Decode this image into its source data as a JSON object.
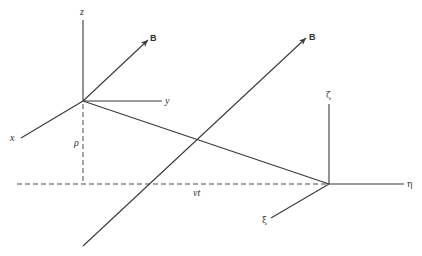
{
  "diagram": {
    "frame1": {
      "origin": [
        83,
        101
      ],
      "labels": {
        "z": "z",
        "y": "y",
        "x": "x",
        "B": "B"
      }
    },
    "frame2": {
      "origin": [
        329,
        184
      ],
      "labels": {
        "zeta": "ζ",
        "eta": "η",
        "xi": "ξ"
      }
    },
    "field_line": {
      "label": "B"
    },
    "annotations": {
      "rho": "ρ",
      "vt": "vt"
    },
    "colors": {
      "line": "#3a3a3a",
      "background": "#ffffff"
    }
  }
}
